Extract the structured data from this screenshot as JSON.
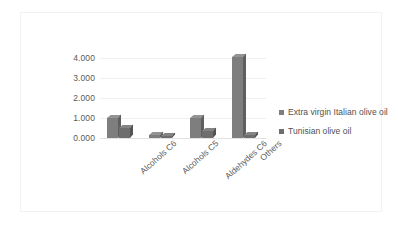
{
  "chart_data": {
    "type": "bar",
    "title": "",
    "subtitle": "",
    "xlabel": "",
    "ylabel": "",
    "categories": [
      "Alcohols C6",
      "Alcohols C5",
      "Aldehydes C6",
      "Others"
    ],
    "series": [
      {
        "name": "Extra virgin Italian olive oil",
        "color": "#7e7e7e",
        "values": [
          1.0,
          0.15,
          1.0,
          4.05
        ]
      },
      {
        "name": "Tunisian olive oil",
        "color": "#6e6e6e",
        "values": [
          0.5,
          0.1,
          0.35,
          0.15
        ]
      }
    ],
    "ylim": [
      0,
      4
    ],
    "yticks": [
      "0.000",
      "1.000",
      "2.000",
      "3.000",
      "4.000"
    ],
    "ytick_values": [
      0,
      1,
      2,
      3,
      4
    ],
    "grid": true,
    "legend_position": "right",
    "style": "3d-column",
    "annotations": []
  },
  "legend": {
    "entries": [
      {
        "label": "Extra virgin Italian olive oil",
        "swatch": "#7e7e7e"
      },
      {
        "label": "Tunisian olive oil",
        "swatch": "#6e6e6e"
      }
    ]
  }
}
